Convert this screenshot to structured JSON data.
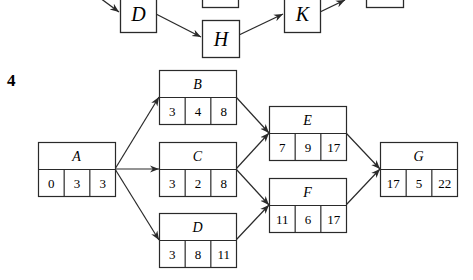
{
  "problem_number": "4",
  "top_fragment": {
    "nodes": [
      {
        "id": "D_top",
        "label": "D",
        "x": 120,
        "y": -5,
        "w": 36,
        "h": 37
      },
      {
        "id": "blank1",
        "label": "",
        "x": 202,
        "y": -30,
        "w": 36,
        "h": 37
      },
      {
        "id": "H",
        "label": "H",
        "x": 202,
        "y": 20,
        "w": 37,
        "h": 37
      },
      {
        "id": "K",
        "label": "K",
        "x": 284,
        "y": -5,
        "w": 36,
        "h": 37
      },
      {
        "id": "blank2",
        "label": "",
        "x": 366,
        "y": -30,
        "w": 37,
        "h": 37
      }
    ],
    "edges": [
      {
        "from": [
          100,
          -2
        ],
        "to": [
          119,
          12
        ]
      },
      {
        "from": [
          156,
          14
        ],
        "to": [
          201,
          37
        ]
      },
      {
        "from": [
          239,
          35
        ],
        "to": [
          283,
          14
        ]
      },
      {
        "from": [
          320,
          12
        ],
        "to": [
          345,
          0
        ]
      }
    ]
  },
  "network": {
    "nodes": [
      {
        "id": "A",
        "label": "A",
        "values": [
          "0",
          "3",
          "3"
        ],
        "x": 38,
        "y": 142
      },
      {
        "id": "B",
        "label": "B",
        "values": [
          "3",
          "4",
          "8"
        ],
        "x": 159,
        "y": 70
      },
      {
        "id": "C",
        "label": "C",
        "values": [
          "3",
          "2",
          "8"
        ],
        "x": 159,
        "y": 142
      },
      {
        "id": "D",
        "label": "D",
        "values": [
          "3",
          "8",
          "11"
        ],
        "x": 159,
        "y": 213
      },
      {
        "id": "E",
        "label": "E",
        "values": [
          "7",
          "9",
          "17"
        ],
        "x": 269,
        "y": 106
      },
      {
        "id": "F",
        "label": "F",
        "values": [
          "11",
          "6",
          "17"
        ],
        "x": 269,
        "y": 178
      },
      {
        "id": "G",
        "label": "G",
        "values": [
          "17",
          "5",
          "22"
        ],
        "x": 380,
        "y": 142
      }
    ],
    "edges": [
      {
        "from": "A",
        "to": "B"
      },
      {
        "from": "A",
        "to": "C"
      },
      {
        "from": "A",
        "to": "D"
      },
      {
        "from": "B",
        "to": "E"
      },
      {
        "from": "C",
        "to": "E"
      },
      {
        "from": "C",
        "to": "F"
      },
      {
        "from": "D",
        "to": "F"
      },
      {
        "from": "E",
        "to": "G"
      },
      {
        "from": "F",
        "to": "G"
      }
    ],
    "box": {
      "w": 77,
      "top_h": 27,
      "bottom_h": 27
    }
  },
  "colors": {
    "stroke": "#2a2a2a",
    "background": "#ffffff"
  }
}
